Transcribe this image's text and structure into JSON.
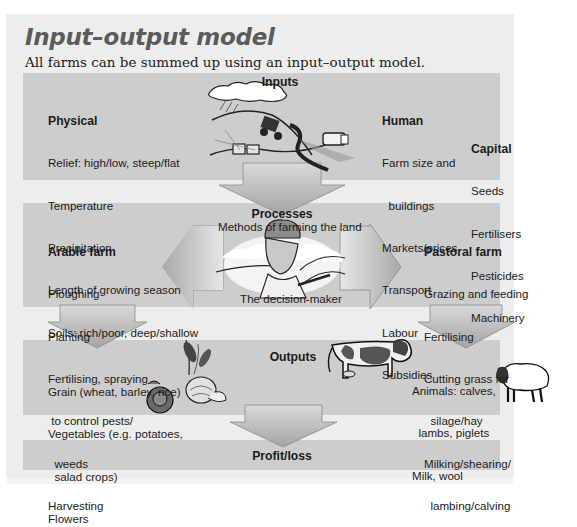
{
  "title": "Input–output model",
  "subtitle": "All farms can be summed up using an input–output model.",
  "inputs": {
    "heading": "Inputs",
    "physical": {
      "heading": "Physical",
      "items": [
        "Relief: high/low, steep/flat",
        "Temperature",
        "Precipitation",
        "Length of growing season",
        "Soils: rich/poor, deep/shallow"
      ]
    },
    "human": {
      "heading": "Human",
      "items": [
        "Farm size and",
        "  buildings",
        "Markets/prices",
        "Transport",
        "Labour",
        "Subsidies"
      ]
    },
    "capital": {
      "heading": "Capital",
      "items": [
        "Seeds",
        "Fertilisers",
        "Pesticides",
        "Machinery"
      ]
    },
    "illustration": "farm-landscape-icon"
  },
  "processes": {
    "heading": "Processes",
    "subheading": "Methods of farming the land",
    "caption": "The decision-maker",
    "illustration": "farmer-portrait-icon",
    "arable": {
      "heading": "Arable farm",
      "items": [
        "Ploughing",
        "Planting",
        "Fertilising, spraying",
        " to control pests/",
        "  weeds",
        "Harvesting"
      ]
    },
    "pastoral": {
      "heading": "Pastoral farm",
      "items": [
        "Grazing and feeding",
        "Fertilising",
        "Cutting grass for",
        "  silage/hay",
        "Milking/shearing/",
        "  lambing/calving"
      ]
    }
  },
  "outputs": {
    "heading": "Outputs",
    "crops": [
      "Grain (wheat, barley, rice)",
      "Vegetables (e.g. potatoes,",
      "  salad crops)",
      "Flowers"
    ],
    "animals": [
      "Animals: calves,",
      "  lambs, piglets",
      "Milk, wool"
    ],
    "illustrations": [
      "wheat-icon",
      "cabbage-icon",
      "onion-icon",
      "cow-icon",
      "sheep-icon"
    ]
  },
  "result": {
    "label": "Profit/loss"
  },
  "colors": {
    "page": "#ededed",
    "band": "#cdcdcd",
    "arrow_light": "#e2e2e2",
    "arrow_dark": "#9c9c9c",
    "title": "#5b5b5b"
  }
}
